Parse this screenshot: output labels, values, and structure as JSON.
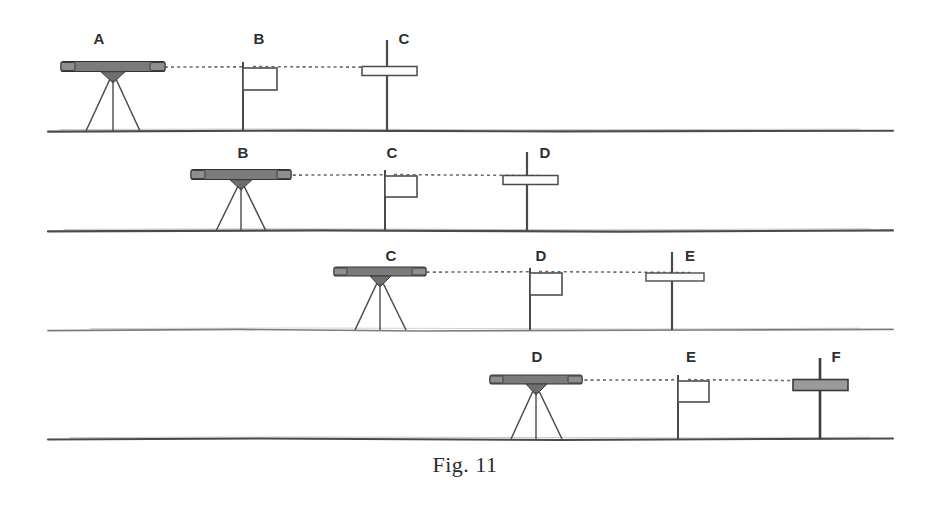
{
  "figure": {
    "caption": "Fig. 11",
    "background_color": "#ffffff",
    "ink_color": "#3a3a3a",
    "sight_line_color": "#6a6a6a",
    "width": 930,
    "height": 510
  },
  "rows": [
    {
      "id": "row-1",
      "ground_y": 131,
      "ground_x1": 48,
      "ground_x2": 893,
      "ground_weight": "heavy",
      "sight_y": 67,
      "sight_x1": 140,
      "sight_x2": 404,
      "instrument": {
        "station": "A",
        "x": 113,
        "label_y": 44,
        "type": "level-on-tripod",
        "beam_half_width": 52,
        "beam_y": 67,
        "tripod_foot_spread": 27,
        "tone": "dark"
      },
      "markers": [
        {
          "station": "B",
          "x": 243,
          "label_y": 44,
          "type": "staff-with-flag-box",
          "top_y": 62,
          "box_w": 34,
          "box_h": 22,
          "tone": "normal"
        },
        {
          "station": "C",
          "x": 387,
          "label_y": 44,
          "type": "cross-staff",
          "top_y": 40,
          "bar_y": 71,
          "bar_x1": 362,
          "bar_x2": 417,
          "bar_h": 9,
          "tone": "light"
        }
      ]
    },
    {
      "id": "row-2",
      "ground_y": 231,
      "ground_x1": 48,
      "ground_x2": 893,
      "ground_weight": "heavy",
      "sight_y": 175,
      "sight_x1": 268,
      "sight_x2": 540,
      "instrument": {
        "station": "B",
        "x": 241,
        "label_y": 158,
        "type": "level-on-tripod",
        "beam_half_width": 50,
        "beam_y": 175,
        "tripod_foot_spread": 25,
        "tone": "dark"
      },
      "markers": [
        {
          "station": "C",
          "x": 385,
          "label_y": 158,
          "type": "staff-with-flag-box",
          "top_y": 170,
          "box_w": 32,
          "box_h": 21,
          "tone": "normal"
        },
        {
          "station": "D",
          "x": 527,
          "label_y": 158,
          "type": "cross-staff",
          "top_y": 152,
          "bar_y": 180,
          "bar_x1": 503,
          "bar_x2": 558,
          "bar_h": 9,
          "tone": "light"
        }
      ]
    },
    {
      "id": "row-3",
      "ground_y": 330,
      "ground_x1": 48,
      "ground_x2": 893,
      "ground_weight": "faint",
      "sight_y": 272,
      "sight_x1": 408,
      "sight_x2": 690,
      "instrument": {
        "station": "C",
        "x": 380,
        "label_y": 261,
        "type": "level-on-tripod",
        "beam_half_width": 46,
        "beam_y": 272,
        "tripod_foot_spread": 26,
        "tone": "dark"
      },
      "markers": [
        {
          "station": "D",
          "x": 530,
          "label_y": 261,
          "type": "staff-with-flag-box",
          "top_y": 268,
          "box_w": 32,
          "box_h": 22,
          "tone": "normal"
        },
        {
          "station": "E",
          "x": 672,
          "label_y": 261,
          "type": "cross-staff",
          "top_y": 252,
          "bar_y": 277,
          "bar_x1": 646,
          "bar_x2": 704,
          "bar_h": 8,
          "tone": "light"
        }
      ]
    },
    {
      "id": "row-4",
      "ground_y": 439,
      "ground_x1": 48,
      "ground_x2": 893,
      "ground_weight": "heavy",
      "sight_y": 380,
      "sight_x1": 572,
      "sight_x2": 800,
      "instrument": {
        "station": "D",
        "x": 536,
        "label_y": 362,
        "type": "level-on-tripod",
        "beam_half_width": 46,
        "beam_y": 380,
        "tripod_foot_spread": 26,
        "tone": "dark"
      },
      "markers": [
        {
          "station": "E",
          "x": 678,
          "label_y": 362,
          "type": "staff-with-flag-box",
          "top_y": 375,
          "box_w": 31,
          "box_h": 21,
          "tone": "normal"
        },
        {
          "station": "F",
          "x": 820,
          "label_y": 362,
          "type": "cross-staff",
          "top_y": 358,
          "bar_y": 385,
          "bar_x1": 793,
          "bar_x2": 848,
          "bar_h": 11,
          "tone": "dark"
        }
      ]
    }
  ]
}
